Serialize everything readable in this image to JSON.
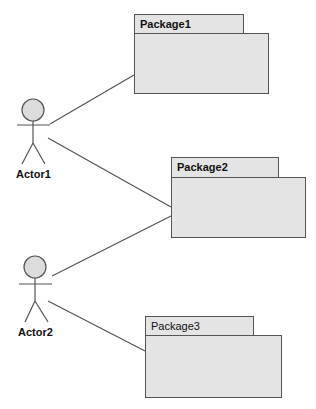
{
  "diagram": {
    "type": "use-case / package diagram",
    "actors": [
      {
        "name": "Actor1",
        "head": [
          33,
          110
        ]
      },
      {
        "name": "Actor2",
        "head": [
          35,
          267
        ]
      }
    ],
    "packages": [
      {
        "name": "Package1"
      },
      {
        "name": "Package2"
      },
      {
        "name": "Package3"
      }
    ],
    "associations": [
      {
        "from": "Actor1",
        "to": "Package1"
      },
      {
        "from": "Actor1",
        "to": "Package2"
      },
      {
        "from": "Actor2",
        "to": "Package2"
      },
      {
        "from": "Actor2",
        "to": "Package3"
      }
    ],
    "colors": {
      "fill": "#e4e4e4",
      "line": "#555555",
      "head_fill": "#dcdcdc"
    }
  }
}
